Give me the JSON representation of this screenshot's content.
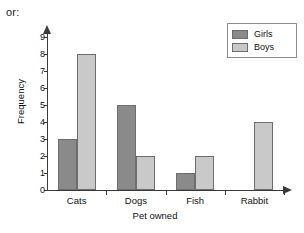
{
  "caption": "or:",
  "chart_data": {
    "type": "bar",
    "title": "",
    "xlabel": "Pet owned",
    "ylabel": "Frequency",
    "categories": [
      "Cats",
      "Dogs",
      "Fish",
      "Rabbit"
    ],
    "series": [
      {
        "name": "Girls",
        "color": "#8a8a8a",
        "values": [
          3,
          5,
          1,
          0
        ]
      },
      {
        "name": "Boys",
        "color": "#c9c9c9",
        "values": [
          8,
          2,
          2,
          4
        ]
      }
    ],
    "ylim": [
      0,
      9
    ],
    "yticks": [
      0,
      1,
      2,
      3,
      4,
      5,
      6,
      7,
      8,
      9
    ],
    "ytick_labels": [
      "0",
      "1",
      "2",
      "3",
      "4",
      "5",
      "6",
      "7",
      "8",
      "9"
    ],
    "grid": false,
    "legend_position": "top-right",
    "legend_entries": [
      "Girls",
      "Boys"
    ],
    "axis_color": "#3a3a3a",
    "bar_border_color": "#6d6d6d"
  }
}
